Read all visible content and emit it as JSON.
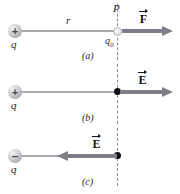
{
  "figure": {
    "kind": "physics-diagram",
    "colors": {
      "background": "#ffffff",
      "charge_sphere": "#c9c9cf",
      "charge_sign": "#4a4a50",
      "connector_line": "#a9a9b0",
      "vector_gray": "#7e7e86",
      "dashed_line": "#8c8c99",
      "point_dot": "#101014",
      "label_text": "#1b1b1f"
    }
  },
  "panels": [
    {
      "caption": "(a)",
      "source_charge": {
        "sign": "+",
        "label": "q"
      },
      "distance_label": "r",
      "point_label": "P",
      "test_charge": {
        "label": "q",
        "subscript": "0"
      },
      "vector": {
        "symbol": "F",
        "direction": "right",
        "accent": "arrow"
      }
    },
    {
      "caption": "(b)",
      "source_charge": {
        "sign": "+",
        "label": "q"
      },
      "point_label": "",
      "vector": {
        "symbol": "E",
        "direction": "right",
        "accent": "arrow"
      }
    },
    {
      "caption": "(c)",
      "source_charge": {
        "sign": "–",
        "label": "q"
      },
      "point_label": "",
      "vector": {
        "symbol": "E",
        "direction": "left",
        "accent": "arrow"
      }
    }
  ]
}
